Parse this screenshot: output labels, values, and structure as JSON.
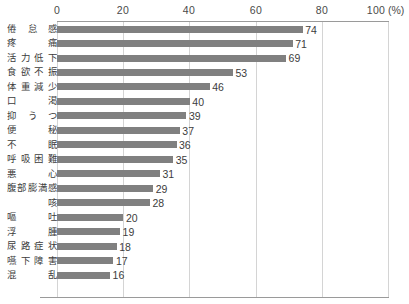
{
  "chart_data": {
    "type": "bar",
    "orientation": "horizontal",
    "title": "",
    "xlabel": "(%)",
    "ylabel": "",
    "xlim": [
      0,
      100
    ],
    "xticks": [
      0,
      20,
      40,
      60,
      80,
      100
    ],
    "xtick_labels": [
      "0",
      "20",
      "40",
      "60",
      "80",
      "100"
    ],
    "unit_label": "(%)",
    "grid": true,
    "grid_axis": "x",
    "legend": false,
    "bar_color": "#808080",
    "categories": [
      "倦怠感",
      "疼 痛",
      "活力低下",
      "食欲不振",
      "体重減少",
      "口 渇",
      "抑うつ",
      "便 秘",
      "不 眠",
      "呼吸困難",
      "悪 心",
      "腹部膨満感",
      "咳",
      "嘔 吐",
      "浮 腫",
      "尿路症状",
      "嚥下障害",
      "混 乱"
    ],
    "values": [
      74,
      71,
      69,
      53,
      46,
      40,
      39,
      37,
      36,
      35,
      31,
      29,
      28,
      20,
      19,
      18,
      17,
      16
    ],
    "data_labels": [
      "74",
      "71",
      "69",
      "53",
      "46",
      "40",
      "39",
      "37",
      "36",
      "35",
      "31",
      "29",
      "28",
      "20",
      "19",
      "18",
      "17",
      "16"
    ]
  }
}
